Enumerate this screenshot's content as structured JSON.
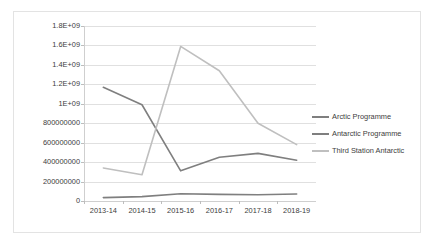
{
  "chart_data": {
    "type": "line",
    "title": "",
    "xlabel": "",
    "ylabel": "",
    "categories": [
      "2013-14",
      "2014-15",
      "2015-16",
      "2016-17",
      "2017-18",
      "2018-19"
    ],
    "series": [
      {
        "name": "Arctic Programme",
        "color": "#7f7f7f",
        "values": [
          35000000,
          45000000,
          75000000,
          68000000,
          65000000,
          72000000
        ]
      },
      {
        "name": "Antarctic Programme",
        "color": "#7f7f7f",
        "values": [
          1170000000,
          990000000,
          310000000,
          450000000,
          490000000,
          420000000
        ]
      },
      {
        "name": "Third Station Antarctic",
        "color": "#bfbfbf",
        "values": [
          340000000,
          270000000,
          1590000000,
          1340000000,
          800000000,
          580000000
        ]
      }
    ],
    "ylim": [
      0,
      1800000000
    ],
    "ytick_values": [
      0,
      200000000,
      400000000,
      600000000,
      800000000,
      1000000000,
      1200000000,
      1400000000,
      1600000000,
      1800000000
    ],
    "ytick_labels": [
      "0",
      "200000000",
      "400000000",
      "600000000",
      "800000000",
      "1E+09",
      "1.2E+09",
      "1.4E+09",
      "1.6E+09",
      "1.8E+09"
    ],
    "grid": true,
    "legend_position": "right"
  },
  "legend": {
    "items": [
      {
        "label": "Arctic Programme",
        "color": "#7f7f7f"
      },
      {
        "label": "Antarctic Programme",
        "color": "#7f7f7f"
      },
      {
        "label": "Third Station Antarctic",
        "color": "#bfbfbf"
      }
    ]
  },
  "colors": {
    "gridline": "#e0e0e0",
    "axis": "#cfcfcf",
    "border": "#e3e3e3",
    "text": "#3d3d3d",
    "background": "#ffffff"
  }
}
